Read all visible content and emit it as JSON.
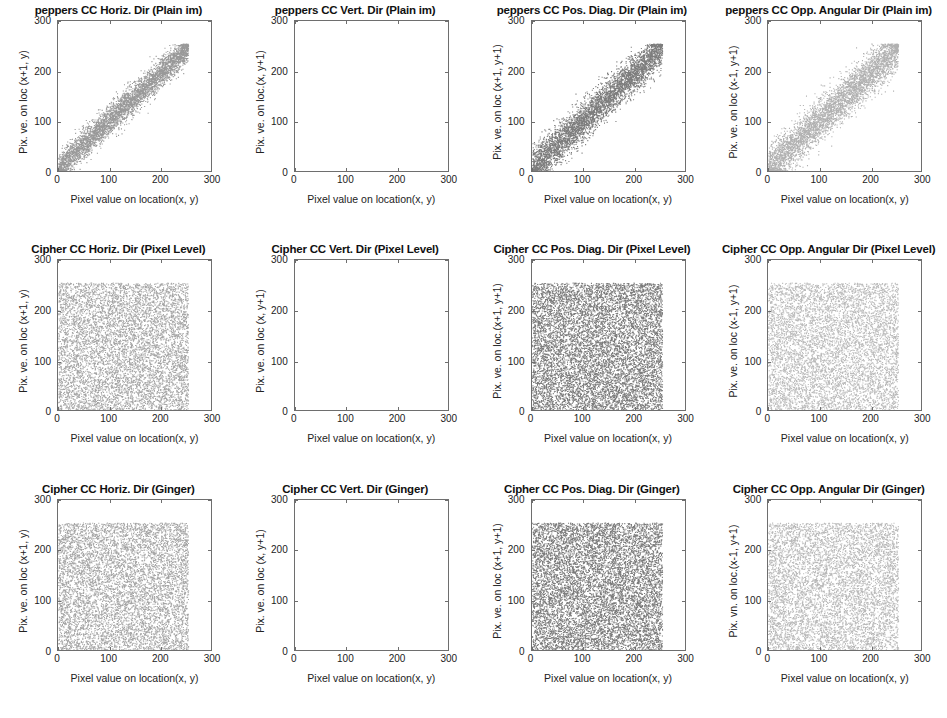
{
  "figure": {
    "rows": 3,
    "cols": 4,
    "background": "#ffffff",
    "axis_color": "#6e6e6e"
  },
  "axes_common": {
    "xlabel": "Pixel value on location(x, y)",
    "xticks": [
      0,
      100,
      200,
      300
    ],
    "yticks": [
      0,
      100,
      200,
      300
    ],
    "xlim": [
      0,
      300
    ],
    "ylim": [
      0,
      300
    ],
    "grid": false
  },
  "chart_data": [
    {
      "id": "p00",
      "type": "scatter",
      "title": "peppers CC Horiz. Dir (Plain im)",
      "xlabel": "Pixel value on location(x, y)",
      "ylabel": "Pix. ve. on loc (x+1, y)",
      "xlim": [
        0,
        300
      ],
      "ylim": [
        0,
        300
      ],
      "xticks": [
        0,
        100,
        200,
        300
      ],
      "yticks": [
        0,
        100,
        200,
        300
      ],
      "grid": false,
      "distribution": "diagonal-correlated",
      "correlation": 0.96,
      "data_range": [
        0,
        255
      ],
      "band_halfwidth": 26,
      "n_points": 4200,
      "marker_color": "#8e8e8e",
      "marker_size": 1.0,
      "description": "Strongly correlated adjacent-pixel cloud along the y=x diagonal, spanning 0-255 in both axes"
    },
    {
      "id": "p01",
      "type": "scatter",
      "title": "peppers CC Vert. Dir (Plain im)",
      "xlabel": "Pixel value on location(x, y)",
      "ylabel": "Pix. ve. on loc.(x, y+1)",
      "xlim": [
        0,
        300
      ],
      "ylim": [
        0,
        300
      ],
      "xticks": [
        0,
        100,
        200,
        300
      ],
      "yticks": [
        0,
        100,
        200,
        300
      ],
      "grid": false,
      "distribution": "blank",
      "correlation": 0.97,
      "data_range": [
        0,
        255
      ],
      "band_halfwidth": 24,
      "n_points": 0,
      "marker_color": "#fbfbfb",
      "marker_size": 0.8,
      "description": "Panel renders essentially empty/white in the source image - markers not visible"
    },
    {
      "id": "p02",
      "type": "scatter",
      "title": "peppers CC Pos. Diag. Dir (Plain im)",
      "xlabel": "Pixel value on location(x, y)",
      "ylabel": "Pix. ve. on loc (x+1, y+1)",
      "xlim": [
        0,
        300
      ],
      "ylim": [
        0,
        300
      ],
      "xticks": [
        0,
        100,
        200,
        300
      ],
      "yticks": [
        0,
        100,
        200,
        300
      ],
      "grid": false,
      "distribution": "diagonal-correlated",
      "correlation": 0.93,
      "data_range": [
        0,
        255
      ],
      "band_halfwidth": 34,
      "n_points": 4600,
      "marker_color": "#6f6f6f",
      "marker_size": 1.0,
      "description": "Diagonal correlated cloud, slightly broader than horizontal direction, dark gray markers"
    },
    {
      "id": "p03",
      "type": "scatter",
      "title": "peppers CC Opp. Angular Dir (Plain im)",
      "xlabel": "Pixel value on location(x, y)",
      "ylabel": "Pix. ve. on loc (x-1, y+1)",
      "xlim": [
        0,
        300
      ],
      "ylim": [
        0,
        300
      ],
      "xticks": [
        0,
        100,
        200,
        300
      ],
      "yticks": [
        0,
        100,
        200,
        300
      ],
      "grid": false,
      "distribution": "diagonal-correlated",
      "correlation": 0.92,
      "data_range": [
        0,
        255
      ],
      "band_halfwidth": 38,
      "n_points": 4300,
      "marker_color": "#a9a9a9",
      "marker_size": 1.0,
      "description": "Anti-diagonal neighbour correlation, wide light-gray diagonal band"
    },
    {
      "id": "p10",
      "type": "scatter",
      "title": "Cipher CC Horiz. Dir (Pixel Level)",
      "xlabel": "Pixel value on location(x, y)",
      "ylabel": "Pix. ve. on loc (x+1, y)",
      "xlim": [
        0,
        300
      ],
      "ylim": [
        0,
        300
      ],
      "xticks": [
        0,
        100,
        200,
        300
      ],
      "yticks": [
        0,
        100,
        200,
        300
      ],
      "grid": false,
      "distribution": "uniform-square",
      "correlation": 0.002,
      "data_range": [
        0,
        255
      ],
      "n_points": 7000,
      "marker_color": "#9b9b9b",
      "marker_size": 1.0,
      "description": "Uniformly filled square 0-255, no correlation structure"
    },
    {
      "id": "p11",
      "type": "scatter",
      "title": "Cipher CC Vert. Dir (Pixel Level)",
      "xlabel": "Pixel value on location(x, y)",
      "ylabel": "Pix. ve. on loc (x, y+1)",
      "xlim": [
        0,
        300
      ],
      "ylim": [
        0,
        300
      ],
      "xticks": [
        0,
        100,
        200,
        300
      ],
      "yticks": [
        0,
        100,
        200,
        300
      ],
      "grid": false,
      "distribution": "blank",
      "correlation": 0.001,
      "data_range": [
        0,
        255
      ],
      "n_points": 0,
      "marker_color": "#fbfbfb",
      "marker_size": 0.8,
      "description": "Panel renders essentially empty/white in the source image"
    },
    {
      "id": "p12",
      "type": "scatter",
      "title": "Cipher CC Pos. Diag. Dir (Pixel Level)",
      "xlabel": "Pixel value on location(x, y)",
      "ylabel": "Pix. ve. on loc.(x+1, y+1)",
      "xlim": [
        0,
        300
      ],
      "ylim": [
        0,
        300
      ],
      "xticks": [
        0,
        100,
        200,
        300
      ],
      "yticks": [
        0,
        100,
        200,
        300
      ],
      "grid": false,
      "distribution": "uniform-square",
      "correlation": 0.003,
      "data_range": [
        0,
        255
      ],
      "n_points": 9000,
      "marker_color": "#6d6d6d",
      "marker_size": 1.0,
      "description": "Dense uniform square, darker gray fill"
    },
    {
      "id": "p13",
      "type": "scatter",
      "title": "Cipher CC Opp. Angular Dir (Pixel Level)",
      "xlabel": "Pixel value on location(x, y)",
      "ylabel": "Pix. ve. on loc (x-1, y+1)",
      "xlim": [
        0,
        300
      ],
      "ylim": [
        0,
        300
      ],
      "xticks": [
        0,
        100,
        200,
        300
      ],
      "yticks": [
        0,
        100,
        200,
        300
      ],
      "grid": false,
      "distribution": "uniform-square",
      "correlation": 0.002,
      "data_range": [
        0,
        255
      ],
      "n_points": 6500,
      "marker_color": "#b3b3b3",
      "marker_size": 1.0,
      "description": "Uniform square, light gray fill"
    },
    {
      "id": "p20",
      "type": "scatter",
      "title": "Cipher CC Horiz. Dir (Ginger)",
      "xlabel": "Pixel value on location(x, y)",
      "ylabel": "Pix. ve. on loc (x+1, y)",
      "xlim": [
        0,
        300
      ],
      "ylim": [
        0,
        300
      ],
      "xticks": [
        0,
        100,
        200,
        300
      ],
      "yticks": [
        0,
        100,
        200,
        300
      ],
      "grid": false,
      "distribution": "uniform-square",
      "correlation": 0.001,
      "data_range": [
        0,
        255
      ],
      "n_points": 7000,
      "marker_color": "#9b9b9b",
      "marker_size": 1.0,
      "description": "Uniformly filled square 0-255"
    },
    {
      "id": "p21",
      "type": "scatter",
      "title": "Cipher CC Vert. Dir (Ginger)",
      "xlabel": "Pixel value on location(x, y)",
      "ylabel": "Pix. ve. on loc (x, y+1)",
      "xlim": [
        0,
        300
      ],
      "ylim": [
        0,
        300
      ],
      "xticks": [
        0,
        100,
        200,
        300
      ],
      "yticks": [
        0,
        100,
        200,
        300
      ],
      "grid": false,
      "distribution": "blank",
      "correlation": 0.002,
      "data_range": [
        0,
        255
      ],
      "n_points": 0,
      "marker_color": "#fbfbfb",
      "marker_size": 0.8,
      "description": "Panel renders essentially empty/white in the source image"
    },
    {
      "id": "p22",
      "type": "scatter",
      "title": "Cipher CC Pos. Diag. Dir (Ginger)",
      "xlabel": "Pixel value on location(x, y)",
      "ylabel": "Pix. ve. on loc (x+1, y+1)",
      "xlim": [
        0,
        300
      ],
      "ylim": [
        0,
        300
      ],
      "xticks": [
        0,
        100,
        200,
        300
      ],
      "yticks": [
        0,
        100,
        200,
        300
      ],
      "grid": false,
      "distribution": "uniform-square",
      "correlation": 0.003,
      "data_range": [
        0,
        255
      ],
      "n_points": 9000,
      "marker_color": "#6d6d6d",
      "marker_size": 1.0,
      "description": "Dense uniform square, darker gray fill"
    },
    {
      "id": "p23",
      "type": "scatter",
      "title": "Cipher CC Opp. Angular Dir (Ginger)",
      "xlabel": "Pixel value on location(x, y)",
      "ylabel": "Pix. vn. on loc.(x-1, y+1)",
      "xlim": [
        0,
        300
      ],
      "ylim": [
        0,
        300
      ],
      "xticks": [
        0,
        100,
        200,
        300
      ],
      "yticks": [
        0,
        100,
        200,
        300
      ],
      "grid": false,
      "distribution": "uniform-square",
      "correlation": 0.001,
      "data_range": [
        0,
        255
      ],
      "n_points": 6500,
      "marker_color": "#b0b0b0",
      "marker_size": 1.0,
      "description": "Uniform square, light gray fill"
    }
  ]
}
